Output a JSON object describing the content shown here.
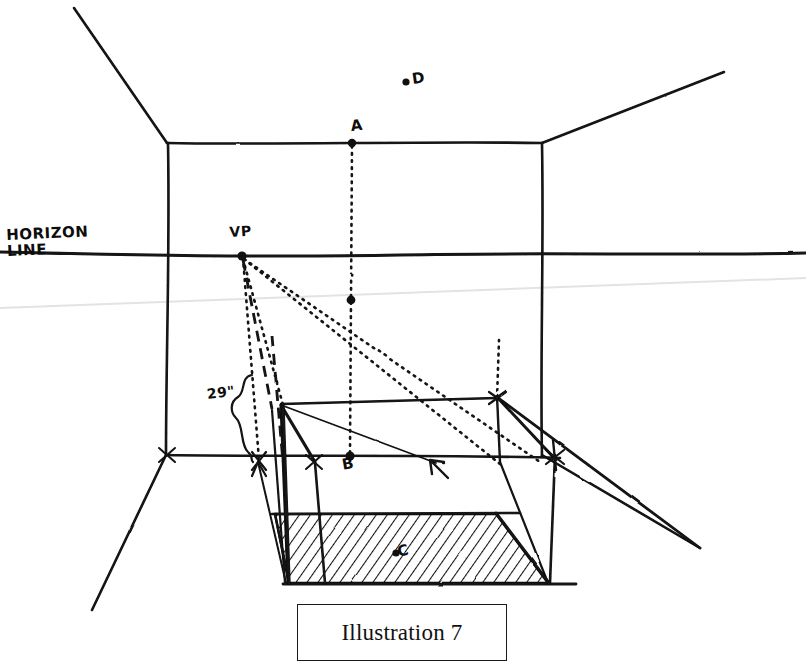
{
  "figure": {
    "caption": "Illustration 7",
    "type": "hand-drawn one-point perspective construction sketch",
    "background_color": "#ffffff",
    "ink_color": "#111111",
    "faint_guide_color": "#e2e2e2"
  },
  "labels": {
    "horizon_line": "HORIZON\nLINE",
    "vanishing_point": "VP",
    "point_a": "A",
    "point_b": "B",
    "point_c": "C",
    "point_d": "D",
    "measurement": "29\""
  },
  "annotations": {
    "horizon_label_lines": [
      "HORIZON",
      "LINE"
    ],
    "measurement_value": "29",
    "measurement_unit": "\"",
    "measurement_full": "29\""
  },
  "geometry": {
    "back_wall": {
      "left": 167,
      "top": 143,
      "right": 542,
      "bottom": 455
    },
    "horizon_y": 256,
    "vanishing_point": {
      "x": 242,
      "y": 256
    },
    "points": {
      "A": {
        "x": 352,
        "y": 140
      },
      "B": {
        "x": 350,
        "y": 456
      },
      "C": {
        "x": 399,
        "y": 556
      },
      "D": {
        "x": 408,
        "y": 82
      },
      "midpoint_on_AB": {
        "x": 351,
        "y": 300
      }
    },
    "hatched_floor": [
      {
        "x": 275,
        "y": 514
      },
      {
        "x": 496,
        "y": 514
      },
      {
        "x": 548,
        "y": 583
      },
      {
        "x": 289,
        "y": 583
      }
    ],
    "brace": {
      "top_y": 375,
      "bottom_y": 462,
      "x": 246
    }
  }
}
